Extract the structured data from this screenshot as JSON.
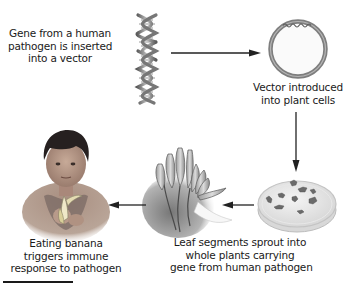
{
  "diagram": {
    "type": "process-flow",
    "steps": [
      {
        "id": "step-1",
        "lines": [
          "Gene from a human",
          "pathogen is inserted",
          "into a vector"
        ],
        "illustration": "dna-double-helix"
      },
      {
        "id": "step-2",
        "lines": [
          "Vector introduced",
          "into plant cells"
        ],
        "illustration": "plasmid-vector-ring"
      },
      {
        "id": "step-3",
        "lines": [
          "Leaf segments sprout into",
          "whole plants carrying",
          "gene from human pathogen"
        ],
        "illustration": "petri-dish-with-leaf-segments"
      },
      {
        "id": "step-4",
        "lines": [
          "Eating banana",
          "triggers immune",
          "response to pathogen"
        ],
        "illustration": "child-eating-banana"
      }
    ],
    "intermediate_illustrations": [
      "banana-plant-sprout"
    ],
    "arrows": [
      {
        "from": "dna-double-helix",
        "to": "plasmid-vector-ring",
        "direction": "right"
      },
      {
        "from": "plasmid-vector-ring",
        "to": "petri-dish-with-leaf-segments",
        "direction": "down"
      },
      {
        "from": "petri-dish-with-leaf-segments",
        "to": "banana-plant-sprout",
        "direction": "left"
      },
      {
        "from": "banana-plant-sprout",
        "to": "child-eating-banana",
        "direction": "left"
      }
    ],
    "colors": {
      "text": "#1a1a1a",
      "arrow": "#222222",
      "ring": "#8a8a8a",
      "dna": "#8c8c8c",
      "dish": "#e6e6e6",
      "leaf_segment": "#6e6e6e",
      "banana": "#c8c8c8",
      "skin": "#b89c8c",
      "hair": "#2a2424"
    }
  }
}
